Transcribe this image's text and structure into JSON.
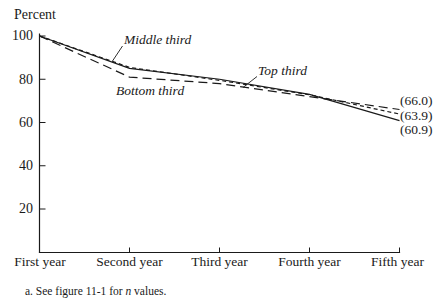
{
  "chart_data": {
    "type": "line",
    "title": "",
    "ylabel": "Percent",
    "categories": [
      "First year",
      "Second year",
      "Third year",
      "Fourth year",
      "Fifth year"
    ],
    "y_ticks": [
      "100",
      "80",
      "60",
      "40",
      "20"
    ],
    "y_tick_values": [
      100,
      80,
      60,
      40,
      20
    ],
    "ylim": [
      0,
      100
    ],
    "grid": false,
    "legend": "inline-annotations",
    "line_color": "#1a1a1a",
    "background": "#ffffff",
    "series": [
      {
        "name": "Top third",
        "line_style": "solid",
        "values": [
          100,
          85,
          80,
          73,
          60.9
        ],
        "end_label": "(60.9)"
      },
      {
        "name": "Middle third",
        "line_style": "short-dash",
        "values": [
          100,
          85.5,
          79.5,
          72.8,
          63.9
        ],
        "end_label": "(63.9)"
      },
      {
        "name": "Bottom third",
        "line_style": "long-dash",
        "values": [
          100,
          81,
          78,
          72,
          66.0
        ],
        "end_label": "(66.0)"
      }
    ]
  },
  "footnote": {
    "prefix": "a. See figure 11-1 for ",
    "italic_term": "n",
    "suffix": " values."
  }
}
